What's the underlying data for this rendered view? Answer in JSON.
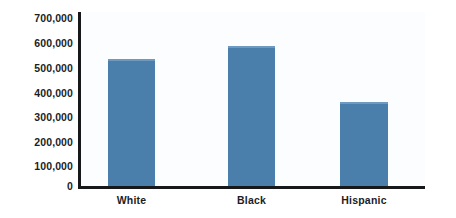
{
  "chart_data": {
    "type": "bar",
    "title": "",
    "subtitle": "",
    "xlabel": "",
    "ylabel": "",
    "categories": [
      "White",
      "Black",
      "Hispanic"
    ],
    "values": [
      510000,
      565000,
      340000
    ],
    "ylim": [
      0,
      700000
    ],
    "y_ticks": [
      0,
      100000,
      200000,
      300000,
      400000,
      500000,
      600000,
      700000
    ],
    "y_tick_labels": [
      "0",
      "100,000",
      "200,000",
      "300,000",
      "400,000",
      "500,000",
      "600,000",
      "700,000"
    ],
    "grid": false,
    "legend": null,
    "legend_position": "none",
    "series": [
      {
        "name": "",
        "values": [
          510000,
          565000,
          340000
        ],
        "color": "#4a7eab"
      }
    ],
    "annotations": []
  },
  "style": {
    "bar_color": "#4a7eab",
    "bar_highlight_color": "#6e9ac1",
    "axis_color": "#16181a",
    "label_color": "#1b1d1f",
    "plot_background": "#fbfdfe",
    "page_background": "#ffffff"
  }
}
